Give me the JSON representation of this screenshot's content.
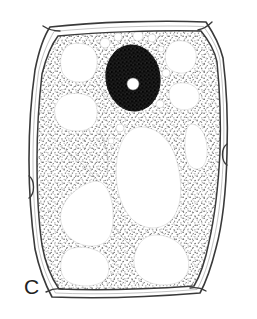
{
  "figure": {
    "panel_label": "C",
    "caption_visible": false,
    "width_px": 257,
    "height_px": 319
  },
  "colors": {
    "background": "#ffffff",
    "ink": "#2b2b2b",
    "wall_line": "#3a3a3a",
    "cytoplasm_stipple": "#6a6a6a",
    "nucleus_fill": "#141414",
    "nucleolus_fill": "#ffffff",
    "vacuole_fill": "#ffffff",
    "label_color": "#222222"
  },
  "structures": {
    "cell_wall": {
      "name": "cell-wall",
      "style": "double-line hexagonal outline with rounded corners and pit notches",
      "outer_points": "50,27 206,22 222,57 227,152 217,245 200,292 52,297 33,248 29,160 35,70",
      "inner_points": "56,34 203,29 216,60 221,152 211,241 195,286 58,290 40,245 36,160 41,73",
      "notch_marks": [
        {
          "name": "pit-right",
          "x": 224,
          "y": 155
        },
        {
          "name": "pit-left",
          "x": 31,
          "y": 188
        },
        {
          "name": "pit-top-left",
          "x": 50,
          "y": 28
        },
        {
          "name": "pit-top-right",
          "x": 205,
          "y": 24
        },
        {
          "name": "pit-bottom-left",
          "x": 52,
          "y": 294
        },
        {
          "name": "pit-bottom-right",
          "x": 199,
          "y": 290
        }
      ]
    },
    "cytoplasm": {
      "name": "cytoplasm",
      "style": "stippled peripheral layer with transvacuolar strands"
    },
    "nucleus": {
      "name": "nucleus",
      "cx": 133,
      "cy": 78,
      "rx": 27,
      "ry": 33,
      "rotation_deg": -8,
      "fill": "dark stipple"
    },
    "nucleolus": {
      "name": "nucleolus",
      "cx": 133,
      "cy": 84,
      "r": 6,
      "fill": "white"
    },
    "vacuoles": [
      {
        "name": "vacuole-upper-left-1",
        "cx": 79,
        "cy": 63,
        "rx": 19,
        "ry": 17
      },
      {
        "name": "vacuole-upper-left-2",
        "cx": 76,
        "cy": 113,
        "rx": 21,
        "ry": 17
      },
      {
        "name": "vacuole-upper-right-1",
        "cx": 180,
        "cy": 56,
        "rx": 16,
        "ry": 15
      },
      {
        "name": "vacuole-upper-right-2",
        "cx": 184,
        "cy": 95,
        "rx": 15,
        "ry": 13
      },
      {
        "name": "vacuole-right-mid",
        "cx": 197,
        "cy": 145,
        "rx": 13,
        "ry": 22
      },
      {
        "name": "vacuole-central-large",
        "cx": 147,
        "cy": 175,
        "rx": 33,
        "ry": 50
      },
      {
        "name": "vacuole-lower-left",
        "cx": 88,
        "cy": 213,
        "rx": 28,
        "ry": 31
      },
      {
        "name": "vacuole-bottom-left",
        "cx": 85,
        "cy": 265,
        "rx": 24,
        "ry": 20
      },
      {
        "name": "vacuole-bottom-right",
        "cx": 162,
        "cy": 258,
        "rx": 27,
        "ry": 24
      }
    ],
    "vesicles": [
      {
        "name": "vesicle-1",
        "cx": 105,
        "cy": 43,
        "r": 5
      },
      {
        "name": "vesicle-2",
        "cx": 118,
        "cy": 37,
        "r": 4
      },
      {
        "name": "vesicle-3",
        "cx": 138,
        "cy": 36,
        "r": 5
      },
      {
        "name": "vesicle-4",
        "cx": 152,
        "cy": 37,
        "r": 4
      },
      {
        "name": "vesicle-5",
        "cx": 160,
        "cy": 48,
        "r": 3
      },
      {
        "name": "vesicle-6",
        "cx": 165,
        "cy": 73,
        "r": 4
      },
      {
        "name": "vesicle-7",
        "cx": 159,
        "cy": 104,
        "r": 4
      },
      {
        "name": "vesicle-8",
        "cx": 120,
        "cy": 127,
        "r": 4
      },
      {
        "name": "vesicle-9",
        "cx": 111,
        "cy": 141,
        "r": 3
      }
    ]
  }
}
